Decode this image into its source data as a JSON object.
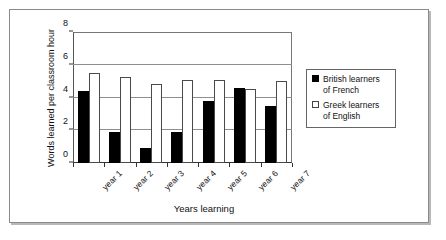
{
  "chart_data": {
    "type": "bar",
    "title": "",
    "subtitle": "",
    "xlabel": "Years learning",
    "ylabel": "Words learned per classroom hour",
    "categories": [
      "year 1",
      "year 2",
      "year 3",
      "year 4",
      "year 5",
      "year 6",
      "year 7"
    ],
    "series": [
      {
        "name": "British learners\nof French",
        "color": "#000000",
        "values": [
          4.4,
          1.9,
          0.9,
          1.9,
          3.8,
          4.6,
          3.5
        ]
      },
      {
        "name": "Greek learners\nof English",
        "color": "#ffffff",
        "values": [
          5.5,
          5.25,
          4.85,
          5.1,
          5.1,
          4.5,
          5.0
        ]
      }
    ],
    "ylim": [
      0,
      8
    ],
    "yticks": [
      0,
      2,
      4,
      6,
      8
    ],
    "ytick_labels": [
      "0",
      "2",
      "4",
      "6",
      "8"
    ],
    "grid": "horizontal",
    "legend_position": "right"
  },
  "legend": {
    "entries": [
      {
        "label": "British learners\nof French"
      },
      {
        "label": "Greek learners\nof English"
      }
    ]
  }
}
